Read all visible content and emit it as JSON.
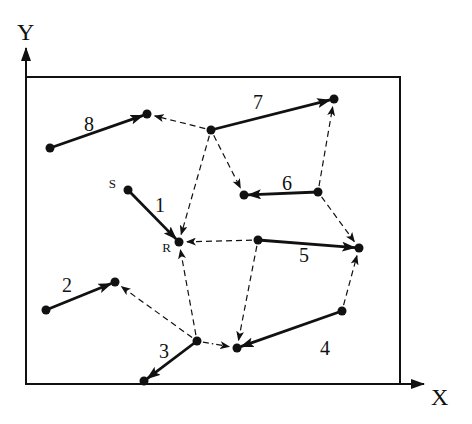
{
  "axes": {
    "x_label": "X",
    "y_label": "Y"
  },
  "colors": {
    "ink": "#111111",
    "background": "#ffffff"
  },
  "box": {
    "left": 26,
    "top": 77,
    "right": 400,
    "bottom": 384
  },
  "nodes": {
    "p8s": {
      "x": 50,
      "y": 148
    },
    "p8e": {
      "x": 147,
      "y": 114
    },
    "p7s": {
      "x": 211,
      "y": 130
    },
    "p7e": {
      "x": 334,
      "y": 99
    },
    "p6s": {
      "x": 318,
      "y": 192
    },
    "p6e": {
      "x": 244,
      "y": 195
    },
    "S": {
      "x": 128,
      "y": 190,
      "label": "S"
    },
    "R": {
      "x": 179,
      "y": 242,
      "label": "R"
    },
    "p5s": {
      "x": 258,
      "y": 240
    },
    "p5e": {
      "x": 359,
      "y": 248
    },
    "p4s": {
      "x": 342,
      "y": 311
    },
    "p4e": {
      "x": 237,
      "y": 348
    },
    "p2s": {
      "x": 46,
      "y": 310
    },
    "p2e": {
      "x": 115,
      "y": 282
    },
    "p3s": {
      "x": 197,
      "y": 341
    },
    "p3e": {
      "x": 144,
      "y": 381
    }
  },
  "segments": [
    {
      "id": "1",
      "label": "1",
      "from": "S",
      "to": "R",
      "label_pos": [
        160,
        212
      ]
    },
    {
      "id": "2",
      "label": "2",
      "from": "p2s",
      "to": "p2e",
      "label_pos": [
        67,
        292
      ]
    },
    {
      "id": "3",
      "label": "3",
      "from": "p3s",
      "to": "p3e",
      "label_pos": [
        164,
        358
      ]
    },
    {
      "id": "4",
      "label": "4",
      "from": "p4s",
      "to": "p4e",
      "label_pos": [
        325,
        355
      ]
    },
    {
      "id": "5",
      "label": "5",
      "from": "p5s",
      "to": "p5e",
      "label_pos": [
        304,
        262
      ]
    },
    {
      "id": "6",
      "label": "6",
      "from": "p6s",
      "to": "p6e",
      "label_pos": [
        287,
        190
      ]
    },
    {
      "id": "7",
      "label": "7",
      "from": "p7s",
      "to": "p7e",
      "label_pos": [
        258,
        109
      ]
    },
    {
      "id": "8",
      "label": "8",
      "from": "p8s",
      "to": "p8e",
      "label_pos": [
        89,
        131
      ]
    }
  ],
  "links": [
    {
      "from": "p7s",
      "to": "p8e",
      "style": "dashed"
    },
    {
      "from": "p7s",
      "to": "R",
      "style": "dashed"
    },
    {
      "from": "p7s",
      "to": "p6e",
      "style": "dashed"
    },
    {
      "from": "p6s",
      "to": "p7e",
      "style": "dashed"
    },
    {
      "from": "p6s",
      "to": "p5e",
      "style": "dashed"
    },
    {
      "from": "p5s",
      "to": "R",
      "style": "dashed"
    },
    {
      "from": "p5s",
      "to": "p4e",
      "style": "dashed"
    },
    {
      "from": "p4s",
      "to": "p5e",
      "style": "dashed"
    },
    {
      "from": "p3s",
      "to": "R",
      "style": "dashed"
    },
    {
      "from": "p3s",
      "to": "p2e",
      "style": "dashed"
    },
    {
      "from": "p3s",
      "to": "p4e",
      "style": "dashdot"
    }
  ]
}
